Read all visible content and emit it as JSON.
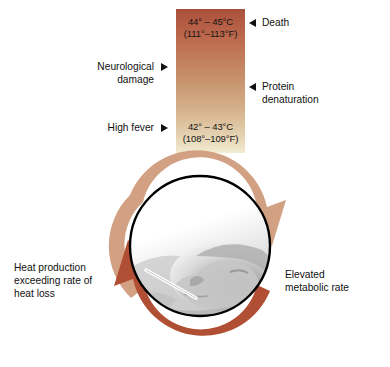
{
  "figure": {
    "name": "positive-feedback-fever-cycle",
    "temperature_bar": {
      "top_label": "44° – 45°C\n(111°–113°F)",
      "top_label_celsius": "44° – 45°C",
      "top_label_fahrenheit": "(111°–113°F)",
      "bottom_label_celsius": "42° – 43°C",
      "bottom_label_fahrenheit": "(108°–109°F)",
      "gradient_top_color": "#a84f3c",
      "gradient_bottom_color": "#f2ecd3"
    },
    "callouts": {
      "death": "Death",
      "protein_denaturation_line1": "Protein",
      "protein_denaturation_line2": "denaturation",
      "neurological_damage_line1": "Neurological",
      "neurological_damage_line2": "damage",
      "high_fever": "High fever"
    },
    "cycle": {
      "left_caption_line1": "Heat production",
      "left_caption_line2": "exceeding rate of",
      "left_caption_line3": "heat loss",
      "right_caption_line1": "Elevated",
      "right_caption_line2": "metabolic rate",
      "left_arrow_color": "#b04f33",
      "right_arrow_color": "#d2a184",
      "photo_description": "grayscale photo of person lying down with thermometer in mouth"
    }
  }
}
